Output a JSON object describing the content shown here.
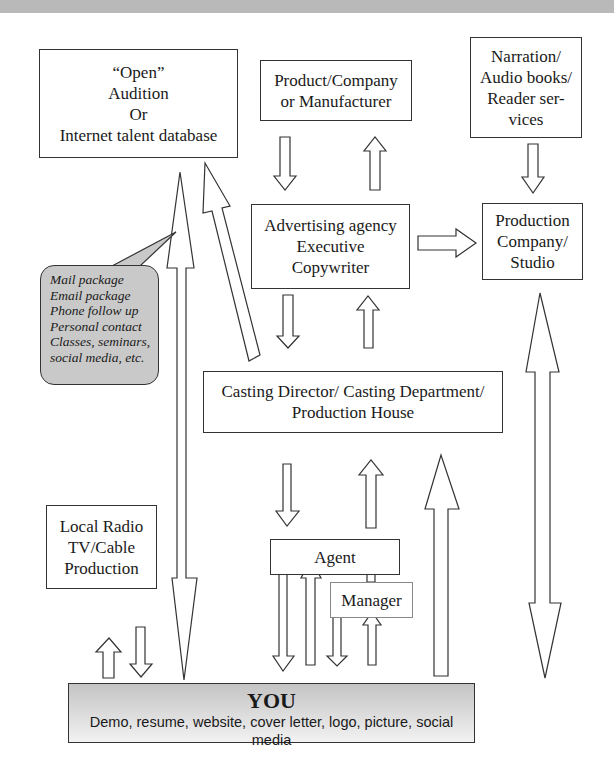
{
  "diagram": {
    "nodes": {
      "open_audition": {
        "lines": [
          "“Open”",
          "Audition",
          "Or",
          "Internet talent database"
        ]
      },
      "product_company": {
        "lines": [
          "Product/Company",
          "or Manufacturer"
        ]
      },
      "narration": {
        "lines": [
          "Narration/",
          "Audio books/",
          "Reader ser-",
          "vices"
        ]
      },
      "advertising_agency": {
        "lines": [
          "Advertising agency",
          "Executive",
          "Copywriter"
        ]
      },
      "production_company": {
        "lines": [
          "Production",
          "Company/",
          "Studio"
        ]
      },
      "casting_director": {
        "lines": [
          "Casting Director/ Casting Department/",
          "Production House"
        ]
      },
      "local_radio": {
        "lines": [
          "Local Radio",
          "TV/Cable",
          "Production"
        ]
      },
      "agent": {
        "lines": [
          "Agent"
        ]
      },
      "manager": {
        "lines": [
          "Manager"
        ]
      },
      "you": {
        "title": "YOU",
        "subtitle": "Demo, resume, website, cover letter, logo, picture, social media"
      }
    },
    "callout": {
      "lines": [
        "Mail package",
        "Email package",
        "Phone follow up",
        "Personal contact",
        "Classes, seminars,",
        "social media, etc."
      ]
    },
    "edges": [
      {
        "from": "product_company",
        "to": "advertising_agency"
      },
      {
        "from": "advertising_agency",
        "to": "product_company"
      },
      {
        "from": "narration",
        "to": "production_company"
      },
      {
        "from": "advertising_agency",
        "to": "production_company"
      },
      {
        "from": "advertising_agency",
        "to": "casting_director"
      },
      {
        "from": "casting_director",
        "to": "advertising_agency"
      },
      {
        "from": "casting_director",
        "to": "open_audition"
      },
      {
        "from": "open_audition",
        "to": "you"
      },
      {
        "from": "you",
        "to": "open_audition"
      },
      {
        "from": "casting_director",
        "to": "agent"
      },
      {
        "from": "agent",
        "to": "casting_director"
      },
      {
        "from": "manager",
        "to": "agent"
      },
      {
        "from": "agent",
        "to": "you"
      },
      {
        "from": "you",
        "to": "agent"
      },
      {
        "from": "manager",
        "to": "you"
      },
      {
        "from": "you",
        "to": "manager"
      },
      {
        "from": "you",
        "to": "casting_director"
      },
      {
        "from": "production_company",
        "to": "you"
      },
      {
        "from": "you",
        "to": "production_company"
      },
      {
        "from": "you",
        "to": "local_radio"
      },
      {
        "from": "local_radio",
        "to": "you"
      }
    ],
    "colors": {
      "callout_fill": "#c9c9c9",
      "you_gradient_top": "#c4c4c4",
      "you_gradient_bottom": "#f2f2f2",
      "stroke": "#333333",
      "topbar": "#b9b9b9"
    }
  }
}
